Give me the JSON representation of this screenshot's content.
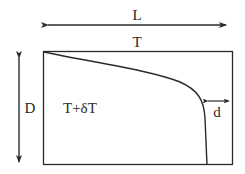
{
  "diagram": {
    "labels": {
      "length": "L",
      "top_temperature": "T",
      "depth": "D",
      "interior_temperature": "T+δT",
      "gap": "d"
    },
    "colors": {
      "stroke": "#2a2a2a",
      "background": "#ffffff"
    }
  }
}
